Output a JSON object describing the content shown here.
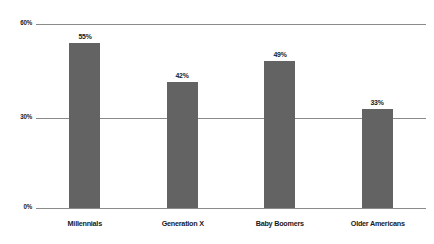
{
  "chart_data": {
    "type": "bar",
    "title": "",
    "subtitle": "",
    "xlabel": "",
    "ylabel": "",
    "categories": [
      "Millennials",
      "Generation X",
      "Baby Boomers",
      "Older Americans"
    ],
    "values": [
      55,
      42,
      49,
      33
    ],
    "data_labels": [
      "55%",
      "42%",
      "49%",
      "33%"
    ],
    "ylim": [
      0,
      60
    ],
    "yticks": [
      0,
      30,
      60
    ],
    "ytick_labels": [
      "0%",
      "30%",
      "60%"
    ],
    "grid": "horizontal",
    "legend": "none",
    "series": [
      {
        "name": "",
        "values": [
          55,
          42,
          49,
          33
        ],
        "color": "#636363"
      }
    ],
    "colors": {
      "bar": "#636363",
      "gridline": "#8a8a8a",
      "axis": "#8a8a8a",
      "text": "#1a1a1a",
      "background": "#ffffff"
    }
  }
}
